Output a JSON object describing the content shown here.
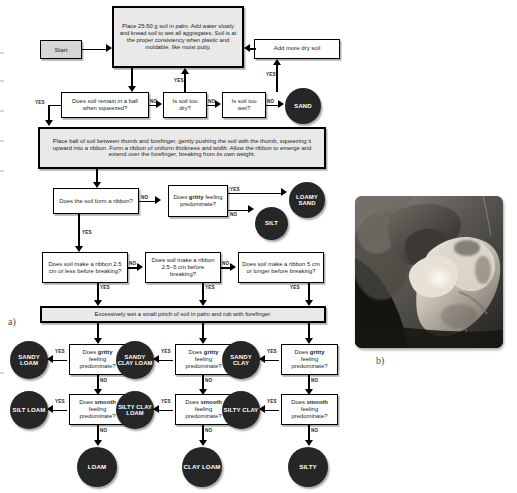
{
  "figure": {
    "panel_a_label": "a)",
    "panel_b_label": "b)",
    "photo_alt": "soil-ribbon-hand-photo"
  },
  "flow": {
    "start": "Start",
    "step_wet": "Place 25-50 g soil in palm. Add water slowly and knead soil to wet all aggregates. Soil is at the proper consistency when plastic and moldable, like moist putty.",
    "add_dry": "Add more dry soil",
    "q_ball": "Does soil remain in a ball when squeezed?",
    "q_too_dry": "Is soil too dry?",
    "q_too_wet": "Is soil too wet?",
    "step_ribbon": "Place ball of soil between thumb and forefinger, gently pushing the soil with the thumb, squeezing it upward into a ribbon. Form a ribbon of uniform thickness and width. Allow the ribbon to emerge and extend over the forefinger, breaking from its own weight.",
    "q_ribbon_form": "Does the soil form a ribbon?",
    "q_ribbon_25_less": "Does soil make a ribbon 2.5 cm or less before breaking?",
    "q_ribbon_25_5": "Does soil make a ribbon 2.5–5 cm before breaking?",
    "q_ribbon_5_longer": "Does soil make a ribbon 5 cm or longer before breaking?",
    "step_wet_pinch": "Excessively wet a small pinch of soil in palm and rub with forefinger.",
    "q_gritty_prefix": "Does ",
    "q_gritty_word": "gritty",
    "q_gritty_suffix": " feeling predominate?",
    "q_smooth_prefix": "Does ",
    "q_smooth_word": "smooth",
    "q_smooth_suffix": " feeling predominate?",
    "yes": "YES",
    "no": "NO"
  },
  "results": {
    "sand": "SAND",
    "loamy_sand": "LOAMY SAND",
    "silt": "SILT",
    "sandy_loam": "SANDY LOAM",
    "silt_loam": "SILT LOAM",
    "loam": "LOAM",
    "sandy_clay_loam": "SANDY CLAY LOAM",
    "silty_clay_loam": "SILTY CLAY LOAM",
    "clay_loam": "CLAY LOAM",
    "sandy_clay": "SANDY CLAY",
    "silty_clay": "SILTY CLAY",
    "silty": "SILTY"
  },
  "colors": {
    "result_fill": "#262626",
    "shade_fill": "#e9e9e9",
    "start_fill": "#d6d6d6",
    "line": "#000000",
    "text": "#231f20"
  }
}
